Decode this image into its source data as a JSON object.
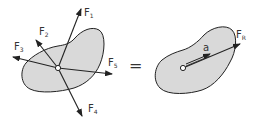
{
  "diagram": {
    "colors": {
      "body_fill": "#d9d9d9",
      "stroke": "#222222",
      "text": "#333333",
      "background": "#ffffff"
    },
    "left": {
      "forces": [
        {
          "id": "F1",
          "main": "F",
          "sub": "1"
        },
        {
          "id": "F2",
          "main": "F",
          "sub": "2"
        },
        {
          "id": "F3",
          "main": "F",
          "sub": "3"
        },
        {
          "id": "F4",
          "main": "F",
          "sub": "4"
        },
        {
          "id": "F5",
          "main": "F",
          "sub": "5"
        }
      ]
    },
    "equals": "=",
    "right": {
      "resultant": {
        "main": "F",
        "sub": "R"
      },
      "acceleration": "a"
    }
  }
}
